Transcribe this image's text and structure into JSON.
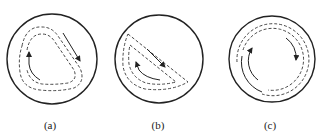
{
  "figure": {
    "panels": [
      {
        "id": "a",
        "label": "(a)",
        "description": "Circular container with rounded-triangle dashed flow loop and two direction arrows"
      },
      {
        "id": "b",
        "label": "(b)",
        "description": "Circular container with wedge-shaped dashed flow loops and two direction arrows"
      },
      {
        "id": "c",
        "label": "(c)",
        "description": "Circular container with concentric dashed/solid circular flow arcs and two direction arrows"
      }
    ],
    "colors": {
      "stroke": "#222222",
      "background": "#ffffff"
    }
  }
}
